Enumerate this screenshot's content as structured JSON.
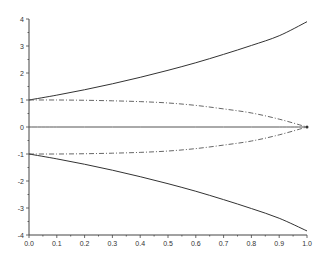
{
  "chart_data": {
    "type": "line",
    "title": "",
    "xlabel": "",
    "ylabel": "",
    "xlim": [
      0.0,
      1.0
    ],
    "ylim": [
      -4,
      4
    ],
    "grid": false,
    "legend": null,
    "x_ticks": [
      "0.0",
      "0.1",
      "0.2",
      "0.3",
      "0.4",
      "0.5",
      "0.6",
      "0.7",
      "0.8",
      "0.9",
      "1.0"
    ],
    "y_ticks": [
      "-4",
      "-3",
      "-2",
      "-1",
      "0",
      "1",
      "2",
      "3",
      "4"
    ],
    "x": [
      0.0,
      0.1,
      0.2,
      0.3,
      0.4,
      0.5,
      0.6,
      0.7,
      0.8,
      0.9,
      1.0
    ],
    "series": [
      {
        "name": "upper-solid",
        "style": "solid",
        "color": "#333333",
        "values": [
          1.0,
          1.18,
          1.38,
          1.6,
          1.84,
          2.1,
          2.38,
          2.69,
          3.02,
          3.38,
          3.9
        ]
      },
      {
        "name": "upper-dashdot",
        "style": "dashdot",
        "color": "#555555",
        "values": [
          1.0,
          1.0,
          0.99,
          0.97,
          0.94,
          0.89,
          0.8,
          0.67,
          0.52,
          0.29,
          0.0
        ]
      },
      {
        "name": "zero-line",
        "style": "solid",
        "color": "#555555",
        "values": [
          0,
          0,
          0,
          0,
          0,
          0,
          0,
          0,
          0,
          0,
          0
        ]
      },
      {
        "name": "lower-dashdot",
        "style": "dashdot",
        "color": "#555555",
        "values": [
          -1.0,
          -1.0,
          -0.99,
          -0.97,
          -0.94,
          -0.89,
          -0.8,
          -0.67,
          -0.52,
          -0.29,
          0.0
        ]
      },
      {
        "name": "lower-solid",
        "style": "solid",
        "color": "#333333",
        "values": [
          -1.0,
          -1.18,
          -1.38,
          -1.6,
          -1.84,
          -2.1,
          -2.38,
          -2.69,
          -3.02,
          -3.38,
          -3.85
        ]
      }
    ]
  }
}
